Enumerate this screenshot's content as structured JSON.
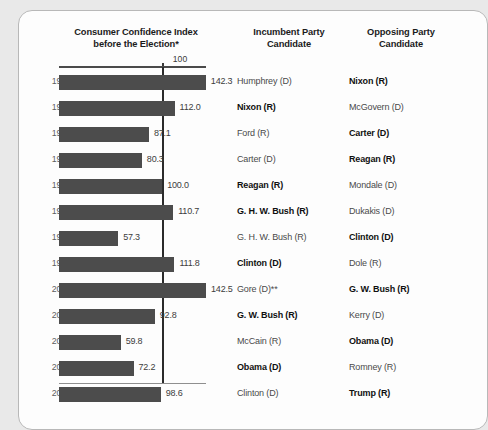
{
  "card": {
    "headers": {
      "chart_column": "Consumer Confidence Index before the Election*",
      "chart_column_line1": "Consumer Confidence Index",
      "chart_column_line2": "before the Election*",
      "incumbent_column_line1": "Incumbent Party",
      "incumbent_column_line2": "Candidate",
      "opposing_column_line1": "Opposing Party",
      "opposing_column_line2": "Candidate"
    },
    "axis_reference_label": "100"
  },
  "colors": {
    "bar": "#4c4c4c",
    "reference_line": "#2b2b2b",
    "card_background": "#fdfdfd",
    "page_background": "#e9e9e9",
    "card_border": "#b8b8b8",
    "winner_text": "#101010",
    "loser_text": "#4a4a4a"
  },
  "chart_data": {
    "type": "bar",
    "orientation": "horizontal",
    "title": "Consumer Confidence Index before the Election*",
    "xlabel": "",
    "ylabel": "",
    "reference_line": 100,
    "xlim": [
      0,
      150
    ],
    "grid": false,
    "legend": "none",
    "categories": [
      "1968",
      "1972",
      "1976",
      "1980",
      "1984",
      "1988",
      "1992",
      "1996",
      "2000",
      "2004",
      "2008",
      "2012",
      "2016"
    ],
    "values": [
      142.3,
      112.0,
      87.1,
      80.3,
      100.0,
      110.7,
      57.3,
      111.8,
      142.5,
      92.8,
      59.8,
      72.2,
      98.6
    ],
    "value_labels": [
      "142.3",
      "112.0",
      "87.1",
      "80.3",
      "100.0",
      "110.7",
      "57.3",
      "111.8",
      "142.5",
      "92.8",
      "59.8",
      "72.2",
      "98.6"
    ]
  },
  "rows": [
    {
      "year": "1968",
      "value": 142.3,
      "value_label": "142.3",
      "incumbent": "Humphrey (D)",
      "incumbent_won": false,
      "opposing": "Nixon (R)",
      "opposing_won": true
    },
    {
      "year": "1972",
      "value": 112.0,
      "value_label": "112.0",
      "incumbent": "Nixon (R)",
      "incumbent_won": true,
      "opposing": "McGovern (D)",
      "opposing_won": false
    },
    {
      "year": "1976",
      "value": 87.1,
      "value_label": "87.1",
      "incumbent": "Ford (R)",
      "incumbent_won": false,
      "opposing": "Carter (D)",
      "opposing_won": true
    },
    {
      "year": "1980",
      "value": 80.3,
      "value_label": "80.3",
      "incumbent": "Carter (D)",
      "incumbent_won": false,
      "opposing": "Reagan (R)",
      "opposing_won": true
    },
    {
      "year": "1984",
      "value": 100.0,
      "value_label": "100.0",
      "incumbent": "Reagan (R)",
      "incumbent_won": true,
      "opposing": "Mondale (D)",
      "opposing_won": false
    },
    {
      "year": "1988",
      "value": 110.7,
      "value_label": "110.7",
      "incumbent": "G. H. W. Bush (R)",
      "incumbent_won": true,
      "opposing": "Dukakis (D)",
      "opposing_won": false
    },
    {
      "year": "1992",
      "value": 57.3,
      "value_label": "57.3",
      "incumbent": "G. H. W. Bush (R)",
      "incumbent_won": false,
      "opposing": "Clinton (D)",
      "opposing_won": true
    },
    {
      "year": "1996",
      "value": 111.8,
      "value_label": "111.8",
      "incumbent": "Clinton (D)",
      "incumbent_won": true,
      "opposing": "Dole (R)",
      "opposing_won": false
    },
    {
      "year": "2000",
      "value": 142.5,
      "value_label": "142.5",
      "incumbent": "Gore (D)**",
      "incumbent_won": false,
      "opposing": "G. W. Bush (R)",
      "opposing_won": true
    },
    {
      "year": "2004",
      "value": 92.8,
      "value_label": "92.8",
      "incumbent": "G. W. Bush (R)",
      "incumbent_won": true,
      "opposing": "Kerry (D)",
      "opposing_won": false
    },
    {
      "year": "2008",
      "value": 59.8,
      "value_label": "59.8",
      "incumbent": "McCain (R)",
      "incumbent_won": false,
      "opposing": "Obama (D)",
      "opposing_won": true
    },
    {
      "year": "2012",
      "value": 72.2,
      "value_label": "72.2",
      "incumbent": "Obama (D)",
      "incumbent_won": true,
      "opposing": "Romney (R)",
      "opposing_won": false
    },
    {
      "year": "2016",
      "value": 98.6,
      "value_label": "98.6",
      "incumbent": "Clinton (D)",
      "incumbent_won": false,
      "opposing": "Trump (R)",
      "opposing_won": true
    }
  ]
}
